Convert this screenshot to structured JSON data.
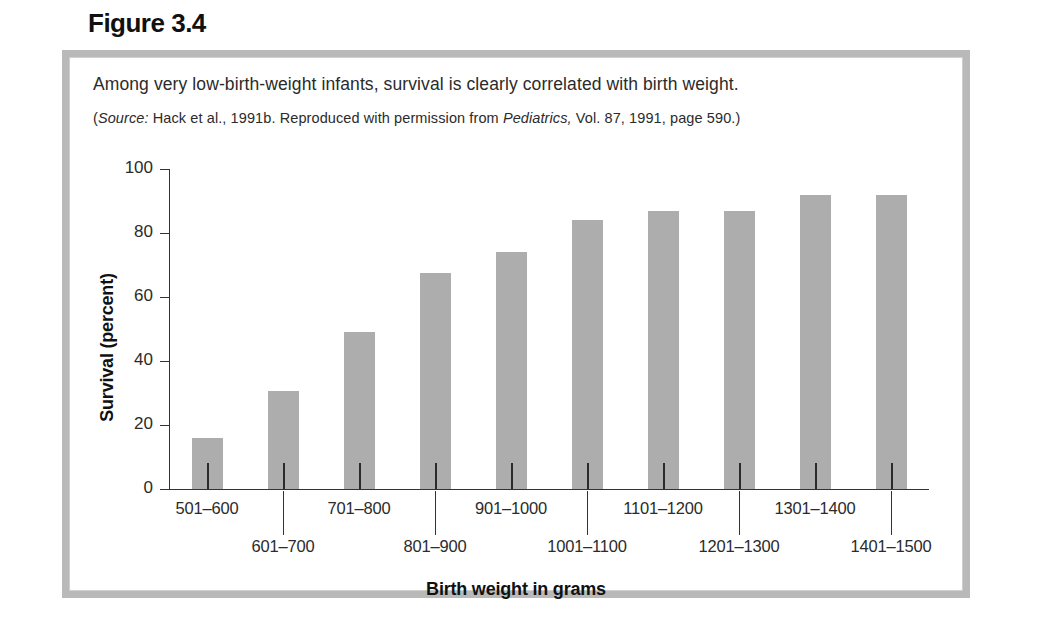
{
  "figure": {
    "label": "Figure 3.4",
    "caption": "Among very low-birth-weight infants, survival is clearly correlated with birth weight.",
    "source_prefix": "(",
    "source_italic_label": "Source:",
    "source_text_a": " Hack et al., 1991b. Reproduced with permission from ",
    "source_italic_journal": "Pediatrics,",
    "source_text_b": " Vol. 87, 1991, page 590.)"
  },
  "colors": {
    "bar_fill": "#adadad",
    "axis": "#333333",
    "frame": "#b9b9b9",
    "text": "#2b2b2b"
  },
  "chart_data": {
    "type": "bar",
    "title": "Among very low-birth-weight infants, survival is clearly correlated with birth weight.",
    "xlabel": "Birth weight in grams",
    "ylabel": "Survival (percent)",
    "ylim": [
      0,
      100
    ],
    "yticks": [
      0,
      20,
      40,
      60,
      80,
      100
    ],
    "ytick_labels": [
      "0",
      "20",
      "40",
      "60",
      "80",
      "100"
    ],
    "grid": false,
    "legend": false,
    "categories": [
      "501–600",
      "601–700",
      "701–800",
      "801–900",
      "901–1000",
      "1001–1100",
      "1101–1200",
      "1201–1300",
      "1301–1400",
      "1401–1500"
    ],
    "values": [
      16,
      30.5,
      49,
      67.5,
      74,
      84,
      87,
      87,
      92,
      92
    ],
    "label_rows": [
      0,
      1,
      0,
      1,
      0,
      1,
      0,
      1,
      0,
      1
    ]
  }
}
